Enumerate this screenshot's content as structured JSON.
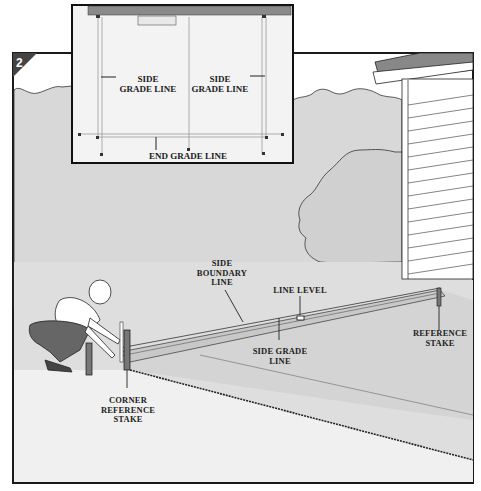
{
  "figure": {
    "step_number": "2",
    "colors": {
      "sky_fill": "#ffffff",
      "ground_fill": "#dcdcdc",
      "tree_fill": "#d2d2d2",
      "frame_stroke": "#1a1a1a",
      "inset_fill": "#f2f2f2",
      "house_bar": "#8a8a8a"
    }
  },
  "inset": {
    "labels": {
      "side_grade_left": [
        "SIDE",
        "GRADE LINE"
      ],
      "side_grade_right": [
        "SIDE",
        "GRADE LINE"
      ],
      "end_grade": "END GRADE LINE"
    }
  },
  "main": {
    "labels": {
      "side_boundary": [
        "SIDE",
        "BOUNDARY",
        "LINE"
      ],
      "line_level": "LINE LEVEL",
      "side_grade": [
        "SIDE GRADE",
        "LINE"
      ],
      "reference_stake": [
        "REFERENCE",
        "STAKE"
      ],
      "corner_reference_stake": [
        "CORNER",
        "REFERENCE",
        "STAKE"
      ]
    }
  }
}
